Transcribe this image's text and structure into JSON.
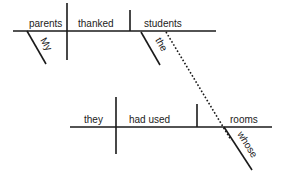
{
  "diagram": {
    "type": "reed-kellogg sentence diagram",
    "sentence": "My parents thanked the students whose rooms they had used.",
    "main_clause": {
      "subject": "parents",
      "verb": "thanked",
      "object": "students",
      "modifiers": {
        "subject": "My",
        "object": "the"
      }
    },
    "relative_clause": {
      "subject": "they",
      "verb": "had used",
      "object": "rooms",
      "modifiers": {
        "object": "whose"
      }
    },
    "connector": "dotted line linking 'students' to 'whose'",
    "line_color": "#1a1a1a"
  }
}
